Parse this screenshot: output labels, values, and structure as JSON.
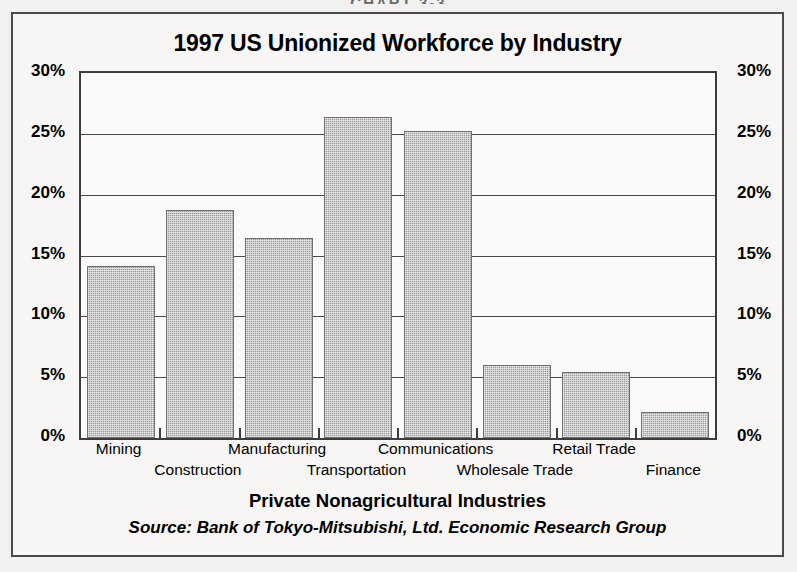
{
  "page": {
    "caption": "CHART 3-3"
  },
  "chart_data": {
    "type": "bar",
    "title": "1997 US Unionized Workforce by Industry",
    "xlabel": "Private Nonagricultural Industries",
    "ylabel": "",
    "source": "Source:  Bank of Tokyo-Mitsubishi, Ltd. Economic Research Group",
    "categories": [
      "Mining",
      "Construction",
      "Manufacturing",
      "Transportation",
      "Communications",
      "Wholesale Trade",
      "Retail Trade",
      "Finance"
    ],
    "values": [
      14.1,
      18.7,
      16.4,
      26.4,
      25.2,
      6.0,
      5.4,
      2.1
    ],
    "value_unit": "%",
    "ylim": [
      0,
      30
    ],
    "ytick_values": [
      0,
      5,
      10,
      15,
      20,
      25,
      30
    ],
    "ytick_labels": [
      "0%",
      "5%",
      "10%",
      "15%",
      "20%",
      "25%",
      "30%"
    ],
    "ytick_labels_right": [
      "0%",
      "5%",
      "10%",
      "15%",
      "20%",
      "25%",
      "30%"
    ],
    "grid": true,
    "legend": false,
    "bar_color": "#9a9a9a",
    "axis_color": "#3d3d3d",
    "background_color": "#f7f6f4",
    "label_rows": [
      0,
      1,
      0,
      1,
      0,
      1,
      0,
      1
    ]
  }
}
